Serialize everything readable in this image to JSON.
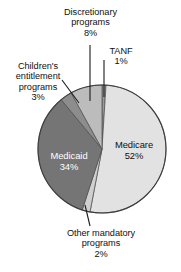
{
  "chart_data": {
    "type": "pie",
    "title": "",
    "subtitle": "",
    "xlabel": "",
    "ylabel": "",
    "legend_position": "none",
    "grid": false,
    "unit": "%",
    "categories": [
      "Medicare",
      "Medicaid",
      "Discretionary programs",
      "Children's entitlement programs",
      "Other mandatory programs",
      "TANF"
    ],
    "values": [
      52,
      34,
      8,
      3,
      2,
      1
    ],
    "slices": [
      {
        "name": "TANF",
        "label": "TANF",
        "value": 1,
        "percent_text": "1%",
        "color": "#9a9a9a",
        "label_placement": "outside",
        "text_color": "#111111"
      },
      {
        "name": "Medicare",
        "label": "Medicare",
        "value": 52,
        "percent_text": "52%",
        "color": "#e2e2e2",
        "label_placement": "inside",
        "text_color": "#111111"
      },
      {
        "name": "Other mandatory programs",
        "label_line1": "Other mandatory",
        "label_line2": "programs",
        "value": 2,
        "percent_text": "2%",
        "color": "#cfcfcf",
        "label_placement": "outside",
        "text_color": "#111111"
      },
      {
        "name": "Medicaid",
        "label": "Medicaid",
        "value": 34,
        "percent_text": "34%",
        "color": "#757575",
        "label_placement": "inside",
        "text_color": "#ffffff"
      },
      {
        "name": "Children's entitlement programs",
        "label_line1": "Children's",
        "label_line2": "entitlement",
        "label_line3": "programs",
        "value": 3,
        "percent_text": "3%",
        "color": "#8d8d8d",
        "label_placement": "outside",
        "text_color": "#111111"
      },
      {
        "name": "Discretionary programs",
        "label_line1": "Discretionary",
        "label_line2": "programs",
        "value": 8,
        "percent_text": "8%",
        "color": "#bcbcbc",
        "label_placement": "outside",
        "text_color": "#111111"
      }
    ]
  },
  "labels": {
    "discretionary": {
      "line1": "Discretionary",
      "line2": "programs",
      "percent": "8%"
    },
    "tanf": {
      "line1": "TANF",
      "percent": "1%"
    },
    "children": {
      "line1": "Children's",
      "line2": "entitlement",
      "line3": "programs",
      "percent": "3%"
    },
    "other": {
      "line1": "Other mandatory",
      "line2": "programs",
      "percent": "2%"
    },
    "medicare": {
      "line1": "Medicare",
      "percent": "52%"
    },
    "medicaid": {
      "line1": "Medicaid",
      "percent": "34%"
    }
  },
  "colors": {
    "medicare": "#e2e2e2",
    "medicaid": "#757575",
    "discretionary": "#bcbcbc",
    "children": "#8d8d8d",
    "other_mandatory": "#cfcfcf",
    "tanf": "#9a9a9a",
    "outline": "#4a4a4a",
    "leader_line": "#1a1a1a",
    "background": "#ffffff"
  }
}
